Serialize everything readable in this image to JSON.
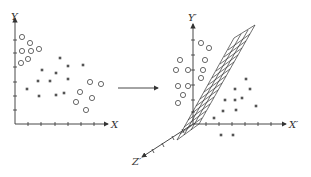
{
  "left_plot": {
    "x_label": "X",
    "y_label": "Y",
    "circles": [
      [
        22,
        37
      ],
      [
        30,
        43
      ],
      [
        22,
        51
      ],
      [
        31,
        51
      ],
      [
        39,
        49
      ],
      [
        28,
        59
      ],
      [
        21,
        63
      ],
      [
        90,
        82
      ],
      [
        101,
        84
      ],
      [
        80,
        92
      ],
      [
        92,
        98
      ],
      [
        76,
        102
      ],
      [
        86,
        110
      ]
    ],
    "squares": [
      [
        60,
        58
      ],
      [
        42,
        70
      ],
      [
        68,
        66
      ],
      [
        56,
        73
      ],
      [
        83,
        65
      ],
      [
        38,
        81
      ],
      [
        50,
        81
      ],
      [
        68,
        79
      ],
      [
        27,
        89
      ],
      [
        39,
        96
      ],
      [
        56,
        95
      ],
      [
        64,
        93
      ]
    ]
  },
  "arrow": {
    "label": "transform"
  },
  "right_plot": {
    "x_label": "X′",
    "y_label": "Y′",
    "z_label": "Z′",
    "circles": [
      [
        201,
        43
      ],
      [
        209,
        48
      ],
      [
        180,
        60
      ],
      [
        205,
        60
      ],
      [
        176,
        70
      ],
      [
        188,
        70
      ],
      [
        203,
        70
      ],
      [
        201,
        78
      ],
      [
        178,
        86
      ],
      [
        188,
        86
      ],
      [
        183,
        95
      ],
      [
        178,
        103
      ]
    ],
    "squares": [
      [
        246,
        79
      ],
      [
        235,
        89
      ],
      [
        250,
        89
      ],
      [
        225,
        100
      ],
      [
        235,
        100
      ],
      [
        242,
        98
      ],
      [
        256,
        106
      ],
      [
        223,
        111
      ],
      [
        236,
        110
      ],
      [
        214,
        118
      ],
      [
        221,
        135
      ],
      [
        233,
        135
      ]
    ]
  }
}
